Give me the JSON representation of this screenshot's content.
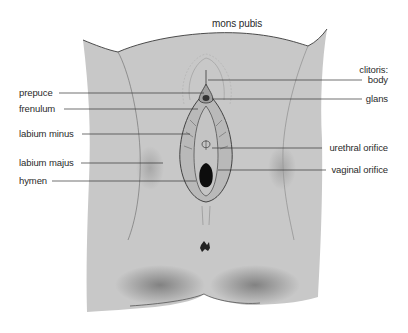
{
  "diagram": {
    "title_label": "mons pubis",
    "left_labels": [
      {
        "text": "prepuce",
        "y": 93
      },
      {
        "text": "frenulum",
        "y": 109
      },
      {
        "text": "labium minus",
        "y": 134
      },
      {
        "text": "labium majus",
        "y": 163
      },
      {
        "text": "hymen",
        "y": 181
      }
    ],
    "right_group_label": "clitoris:",
    "right_labels": [
      {
        "text": "body",
        "y": 80
      },
      {
        "text": "glans",
        "y": 99
      },
      {
        "text": "urethral orifice",
        "y": 148
      },
      {
        "text": "vaginal orifice",
        "y": 170
      }
    ],
    "colors": {
      "skin_fill": "#c8c8c8",
      "outline": "#3a3a3a",
      "leader_line": "#333333",
      "label_text": "#2a2a2a",
      "background": "#ffffff"
    }
  }
}
